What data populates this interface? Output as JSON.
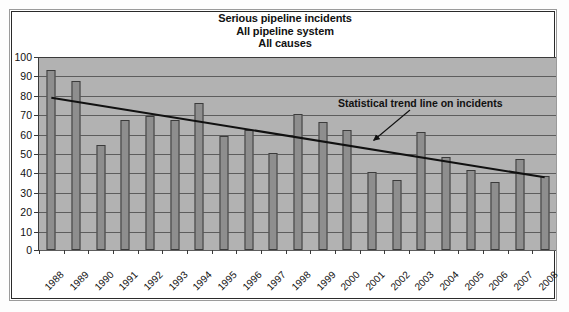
{
  "chart_data": {
    "type": "bar",
    "title": "Serious pipeline incidents\nAll pipeline system\nAll causes",
    "title_lines": [
      "Serious pipeline incidents",
      "All pipeline system",
      "All causes"
    ],
    "xlabel": "",
    "ylabel": "",
    "ylim": [
      0,
      100
    ],
    "ytick_step": 10,
    "yticks": [
      0,
      10,
      20,
      30,
      40,
      50,
      60,
      70,
      80,
      90,
      100
    ],
    "ytick_labels": [
      "0",
      "10",
      "20",
      "30",
      "40",
      "50",
      "60",
      "70",
      "80",
      "90",
      "100"
    ],
    "grid": true,
    "legend": "none",
    "categories": [
      "1988",
      "1989",
      "1990",
      "1991",
      "1992",
      "1993",
      "1994",
      "1995",
      "1996",
      "1997",
      "1998",
      "1999",
      "2000",
      "2001",
      "2002",
      "2003",
      "2004",
      "2005",
      "2006",
      "2007",
      "2008"
    ],
    "values": [
      93,
      87,
      54,
      67,
      69,
      67,
      76,
      59,
      62,
      50,
      70,
      66,
      62,
      40,
      36,
      61,
      48,
      41,
      35,
      47,
      38
    ],
    "series": [
      {
        "name": "Serious pipeline incidents",
        "type": "bar",
        "values": [
          93,
          87,
          54,
          67,
          69,
          67,
          76,
          59,
          62,
          50,
          70,
          66,
          62,
          40,
          36,
          61,
          48,
          41,
          35,
          47,
          38
        ]
      },
      {
        "name": "Statistical trend line on incidents",
        "type": "line",
        "start_value": 79,
        "end_value": 38,
        "start_category": "1988",
        "end_category": "2008"
      }
    ],
    "annotations": [
      {
        "text": "Statistical trend line on incidents",
        "points_to": "trend-line"
      }
    ],
    "colors": {
      "plot_background": "#b2b2b2",
      "bar_fill": "#8e8e8e",
      "bar_border": "#3b3b3b",
      "gridline": "#5d5d5d",
      "axis": "#3a3a3a",
      "trend_line": "#111111",
      "text": "#111111",
      "page_background": "#ffffff"
    }
  }
}
